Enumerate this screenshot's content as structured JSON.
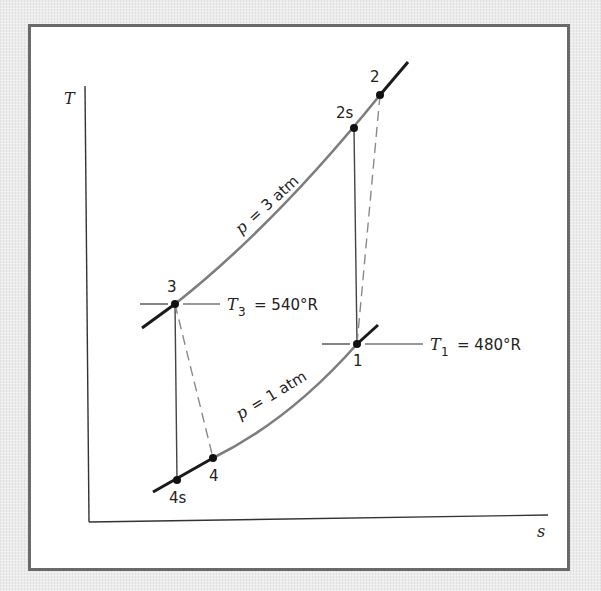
{
  "diagram": {
    "type": "T-s diagram (Brayton cycle, compressor and turbine)",
    "axes": {
      "y_label": "T",
      "x_label": "s"
    },
    "isobars": [
      {
        "label": "p = 3 atm",
        "p_symbol": "p",
        "eq": "=",
        "value": "3 atm"
      },
      {
        "label": "p = 1 atm",
        "p_symbol": "p",
        "eq": "=",
        "value": "1 atm"
      }
    ],
    "states": [
      {
        "id": "1",
        "label": "1"
      },
      {
        "id": "2",
        "label": "2"
      },
      {
        "id": "2s",
        "label": "2s"
      },
      {
        "id": "3",
        "label": "3"
      },
      {
        "id": "4",
        "label": "4"
      },
      {
        "id": "4s",
        "label": "4s"
      }
    ],
    "temperature_annotations": [
      {
        "symbol": "T",
        "subscript": "3",
        "text": "= 540°R",
        "full": "T3 = 540°R"
      },
      {
        "symbol": "T",
        "subscript": "1",
        "text": "= 480°R",
        "full": "T1 = 480°R"
      }
    ],
    "colors": {
      "curve_gray": "#7d7d7d",
      "curve_black": "#1a1a1a",
      "frame": "#6a6a6a",
      "dashed": "#8a8a8a"
    }
  }
}
